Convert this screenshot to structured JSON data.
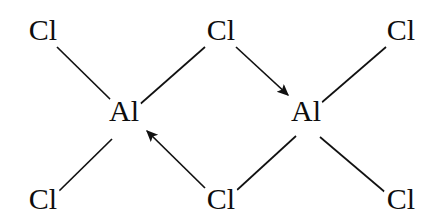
{
  "diagram": {
    "molecule_formula": "Al2Cl6",
    "background_color": "#ffffff",
    "atom_color": "#0d0d0d",
    "bond_color": "#111111",
    "width": 424,
    "height": 222,
    "atoms": [
      {
        "id": "cl-top-left",
        "label": "Cl",
        "element": "Cl",
        "x": 43,
        "y": 40
      },
      {
        "id": "cl-top-center",
        "label": "Cl",
        "element": "Cl",
        "x": 221,
        "y": 40
      },
      {
        "id": "cl-top-right",
        "label": "Cl",
        "element": "Cl",
        "x": 401,
        "y": 40
      },
      {
        "id": "al-left",
        "label": "Al",
        "element": "Al",
        "x": 124,
        "y": 121
      },
      {
        "id": "al-right",
        "label": "Al",
        "element": "Al",
        "x": 306,
        "y": 121
      },
      {
        "id": "cl-bottom-left",
        "label": "Cl",
        "element": "Cl",
        "x": 43,
        "y": 209
      },
      {
        "id": "cl-bottom-center",
        "label": "Cl",
        "element": "Cl",
        "x": 221,
        "y": 209
      },
      {
        "id": "cl-bottom-right",
        "label": "Cl",
        "element": "Cl",
        "x": 401,
        "y": 209
      }
    ],
    "bonds": [
      {
        "id": "bond-cl-top-left--al-left",
        "from": "cl-top-left",
        "to": "al-left",
        "type": "covalent",
        "x1": 57,
        "y1": 47,
        "x2": 112,
        "y2": 101
      },
      {
        "id": "bond-cl-bottom-left--al-left",
        "from": "cl-bottom-left",
        "to": "al-left",
        "type": "covalent",
        "x1": 57,
        "y1": 193,
        "x2": 112,
        "y2": 139
      },
      {
        "id": "bond-cl-top-center--al-left",
        "from": "cl-top-center",
        "to": "al-left",
        "type": "covalent",
        "x1": 205,
        "y1": 47,
        "x2": 138,
        "y2": 106
      },
      {
        "id": "bond-cl-top-right--al-right",
        "from": "cl-top-right",
        "to": "al-right",
        "type": "covalent",
        "x1": 386,
        "y1": 47,
        "x2": 320,
        "y2": 104
      },
      {
        "id": "bond-cl-bottom-right--al-right",
        "from": "cl-bottom-right",
        "to": "al-right",
        "type": "covalent",
        "x1": 386,
        "y1": 193,
        "x2": 320,
        "y2": 137
      },
      {
        "id": "bond-cl-bottom-center--al-right",
        "from": "cl-bottom-center",
        "to": "al-right",
        "type": "covalent",
        "x1": 237,
        "y1": 190,
        "x2": 296,
        "y2": 136
      }
    ],
    "dative_bonds": [
      {
        "id": "dative-cl-top-center--al-right",
        "from": "cl-top-center",
        "to": "al-right",
        "type": "dative-arrow",
        "x1": 236,
        "y1": 47,
        "x2": 295,
        "y2": 102,
        "direction": "down-right"
      },
      {
        "id": "dative-cl-bottom-center--al-left",
        "from": "cl-bottom-center",
        "to": "al-left",
        "type": "dative-arrow",
        "x1": 205,
        "y1": 188,
        "x2": 140,
        "y2": 124,
        "direction": "up-left"
      }
    ]
  }
}
